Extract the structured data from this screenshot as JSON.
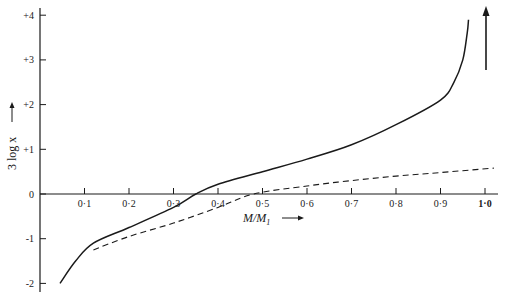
{
  "chart_data": {
    "type": "line",
    "title": "",
    "xlabel": "M/M1",
    "ylabel": "3 log x",
    "xlim": [
      0,
      1.0
    ],
    "ylim": [
      -2,
      4
    ],
    "grid": false,
    "legend": null,
    "x_ticks": [
      "0·1",
      "0·2",
      "0·3",
      "0·4",
      "0·5",
      "0·6",
      "0·7",
      "0·8",
      "0·9",
      "1·0"
    ],
    "y_ticks": [
      "-2",
      "-1",
      "0",
      "+1",
      "+2",
      "+3",
      "+4"
    ],
    "series": [
      {
        "name": "solid",
        "style": "solid",
        "x": [
          0.045,
          0.08,
          0.12,
          0.2,
          0.3,
          0.35,
          0.4,
          0.5,
          0.6,
          0.7,
          0.8,
          0.9,
          0.93,
          0.95,
          0.96,
          0.963
        ],
        "y": [
          -2.0,
          -1.5,
          -1.1,
          -0.75,
          -0.3,
          0.0,
          0.22,
          0.5,
          0.78,
          1.1,
          1.55,
          2.1,
          2.5,
          3.0,
          3.6,
          3.9
        ]
      },
      {
        "name": "dashed",
        "style": "dashed",
        "x": [
          0.12,
          0.2,
          0.3,
          0.4,
          0.48,
          0.6,
          0.7,
          0.8,
          0.9,
          1.02
        ],
        "y": [
          -1.25,
          -0.95,
          -0.65,
          -0.3,
          0.0,
          0.18,
          0.3,
          0.4,
          0.48,
          0.58
        ]
      }
    ],
    "annotations": [
      {
        "text": "upward arrow at M/M1 = 1.0 indicating asymptote",
        "x": 1.0
      }
    ]
  },
  "axes": {
    "xlabel_main": "M/M",
    "xlabel_sub": "1",
    "arrow": "⟶",
    "ylabel_text": "3 log x"
  }
}
